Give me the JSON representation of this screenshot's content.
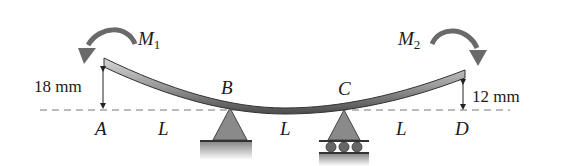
{
  "diagram": {
    "points": [
      {
        "id": "A",
        "label": "A"
      },
      {
        "id": "B",
        "label": "B"
      },
      {
        "id": "C",
        "label": "C"
      },
      {
        "id": "D",
        "label": "D"
      }
    ],
    "spans": [
      {
        "label": "L"
      },
      {
        "label": "L"
      },
      {
        "label": "L"
      }
    ],
    "moments": [
      {
        "label": "M",
        "subscript": "1"
      },
      {
        "label": "M",
        "subscript": "2"
      }
    ],
    "dimensions": [
      {
        "label": "18 mm"
      },
      {
        "label": "12 mm"
      }
    ],
    "colors": {
      "beam_light": "#b8b8b8",
      "beam_dark": "#555555",
      "support": "#8a8a8a",
      "arrow": "#666666",
      "dash": "#777777"
    }
  }
}
